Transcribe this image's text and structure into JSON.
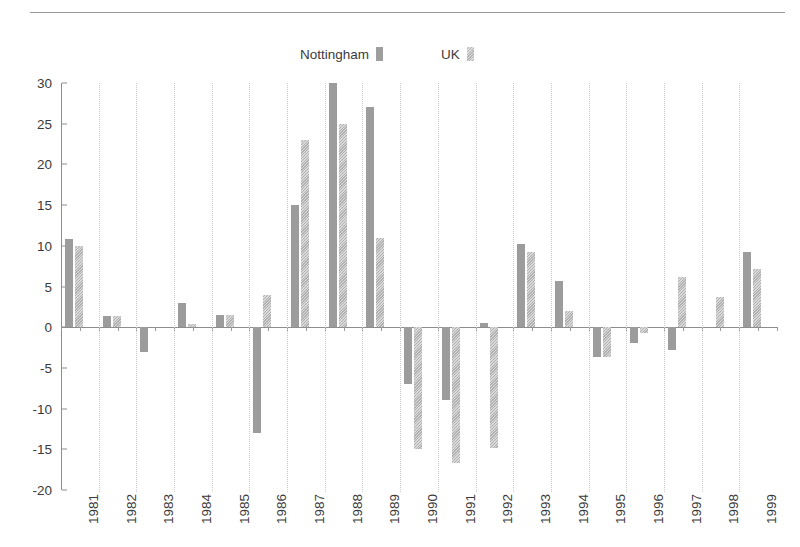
{
  "legend": {
    "entries": [
      {
        "label": "Nottingham",
        "swatch": "solid-swatch-icon",
        "color": "#9c9c9c"
      },
      {
        "label": "UK",
        "swatch": "hatched-swatch-icon",
        "color": "#b2b2b2"
      }
    ]
  },
  "chart_data": {
    "type": "bar",
    "title": "",
    "subtitle": "",
    "xlabel": "",
    "ylabel": "",
    "ylim": [
      -20,
      30
    ],
    "ytick_step": 5,
    "yticks": [
      30,
      25,
      20,
      15,
      10,
      5,
      0,
      -5,
      -10,
      -15,
      -20
    ],
    "grid": "vertical-dotted",
    "legend_position": "top-center",
    "categories": [
      "1981",
      "1982",
      "1983",
      "1984",
      "1985",
      "1986",
      "1987",
      "1988",
      "1989",
      "1990",
      "1991",
      "1992",
      "1993",
      "1994",
      "1995",
      "1996",
      "1997",
      "1998",
      "1999"
    ],
    "series": [
      {
        "name": "Nottingham",
        "color": "#9c9c9c",
        "values": [
          10.8,
          1.4,
          -3.0,
          3.0,
          1.5,
          -13.0,
          15.0,
          30.0,
          27.0,
          -7.0,
          -9.0,
          0.5,
          10.2,
          5.7,
          -3.7,
          -2.0,
          -2.8,
          0.0,
          9.2
        ]
      },
      {
        "name": "UK",
        "color": "#b2b2b2",
        "values": [
          10.0,
          1.4,
          0.0,
          0.4,
          1.5,
          4.0,
          23.0,
          25.0,
          11.0,
          -15.0,
          -16.7,
          -14.8,
          9.2,
          2.0,
          -3.7,
          -0.7,
          6.2,
          3.7,
          7.2
        ]
      }
    ]
  }
}
